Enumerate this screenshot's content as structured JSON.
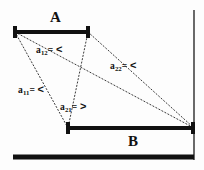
{
  "figure": {
    "width": 204,
    "height": 170,
    "background_color": "#fdfdfd",
    "ink_color": "#111111",
    "dotted_color": "#3a3a3a"
  },
  "segments": [
    {
      "name": "A",
      "label": "A",
      "label_x": 50,
      "label_y": 10,
      "x1": 15,
      "x2": 88,
      "y": 32,
      "thickness": 4,
      "endcaps": true
    },
    {
      "name": "B",
      "label": "B",
      "label_x": 128,
      "label_y": 134,
      "x1": 68,
      "x2": 194,
      "y": 128,
      "thickness": 4,
      "endcaps": true
    }
  ],
  "wall": {
    "name": "right-wall",
    "x": 194,
    "y1": 10,
    "y2": 160,
    "thickness": 1.6
  },
  "ground": {
    "name": "ground-bar",
    "x1": 13,
    "x2": 194,
    "y": 157,
    "thickness": 5
  },
  "relations": [
    {
      "id": "a11",
      "base": "a",
      "sub": "11",
      "operator": "<",
      "text": "a11= <",
      "label_x": 18,
      "label_y": 84,
      "from_x": 15,
      "from_y": 32,
      "to_x": 68,
      "to_y": 128
    },
    {
      "id": "a12",
      "base": "a",
      "sub": "12",
      "operator": "<",
      "text": "a12= <",
      "label_x": 36,
      "label_y": 44,
      "from_x": 15,
      "from_y": 32,
      "to_x": 194,
      "to_y": 128
    },
    {
      "id": "a21",
      "base": "a",
      "sub": "21",
      "operator": ">",
      "text": "a21= >",
      "label_x": 60,
      "label_y": 101,
      "from_x": 88,
      "from_y": 32,
      "to_x": 68,
      "to_y": 128
    },
    {
      "id": "a22",
      "base": "a",
      "sub": "22",
      "operator": "<",
      "text": "a22= <",
      "label_x": 110,
      "label_y": 60,
      "from_x": 88,
      "from_y": 32,
      "to_x": 194,
      "to_y": 128
    }
  ]
}
